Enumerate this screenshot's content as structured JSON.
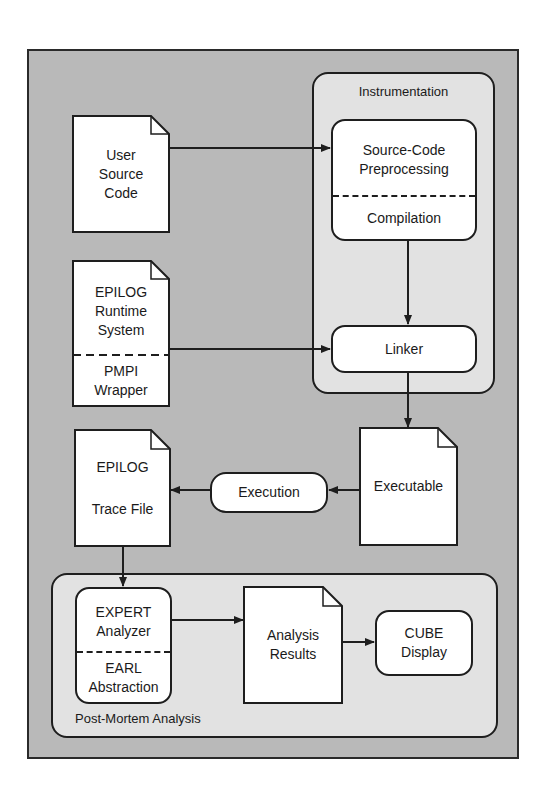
{
  "diagram": {
    "groups": {
      "instrumentation": {
        "label": "Instrumentation"
      },
      "post_mortem": {
        "label": "Post-Mortem Analysis"
      }
    },
    "nodes": {
      "user_source_code": {
        "type": "document",
        "lines": [
          "User",
          "Source",
          "Code"
        ]
      },
      "epilog_runtime": {
        "type": "document",
        "top_lines": [
          "EPILOG",
          "Runtime",
          "System"
        ],
        "bottom_lines": [
          "PMPI",
          "Wrapper"
        ]
      },
      "preprocessing": {
        "type": "process",
        "top_lines": [
          "Source-Code",
          "Preprocessing"
        ],
        "bottom_lines": [
          "Compilation"
        ]
      },
      "linker": {
        "type": "process",
        "label": "Linker"
      },
      "executable": {
        "type": "document",
        "label": "Executable"
      },
      "execution": {
        "type": "process",
        "label": "Execution"
      },
      "trace_file": {
        "type": "document",
        "lines": [
          "EPILOG",
          "Trace File"
        ]
      },
      "expert": {
        "type": "process",
        "top_lines": [
          "EXPERT",
          "Analyzer"
        ],
        "bottom_lines": [
          "EARL",
          "Abstraction"
        ]
      },
      "analysis_results": {
        "type": "document",
        "lines": [
          "Analysis",
          "Results"
        ]
      },
      "cube": {
        "type": "process",
        "lines": [
          "CUBE",
          "Display"
        ]
      }
    },
    "edges": [
      {
        "from": "User Source Code",
        "to": "Source-Code Preprocessing"
      },
      {
        "from": "Compilation",
        "to": "Linker"
      },
      {
        "from": "EPILOG Runtime System / PMPI Wrapper",
        "to": "Linker"
      },
      {
        "from": "Linker",
        "to": "Executable"
      },
      {
        "from": "Executable",
        "to": "Execution"
      },
      {
        "from": "Execution",
        "to": "EPILOG Trace File"
      },
      {
        "from": "EPILOG Trace File",
        "to": "EXPERT Analyzer"
      },
      {
        "from": "EXPERT Analyzer",
        "to": "Analysis Results"
      },
      {
        "from": "Analysis Results",
        "to": "CUBE Display"
      }
    ],
    "colors": {
      "frame_bg": "#b9b9b9",
      "group_bg": "#e2e2e2",
      "node_bg": "#ffffff",
      "stroke": "#1e1e1e"
    }
  }
}
